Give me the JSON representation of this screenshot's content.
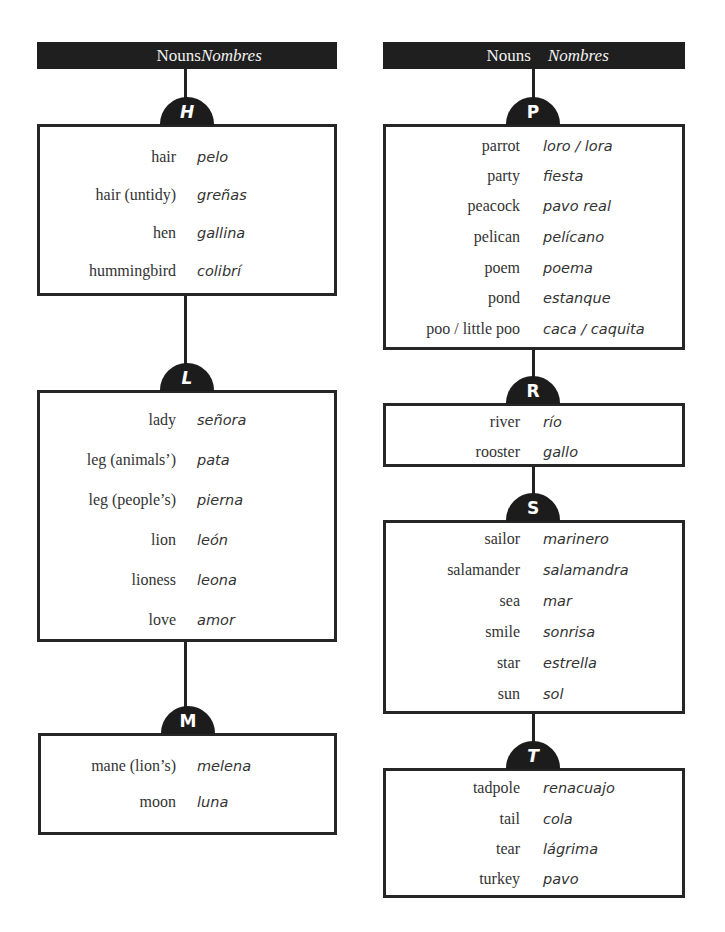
{
  "columns": [
    {
      "header": {
        "en": "Nouns",
        "es": "Nombres"
      },
      "sections": [
        {
          "letter": "H",
          "entries": [
            {
              "en": "hair",
              "es": "pelo"
            },
            {
              "en": "hair (untidy)",
              "es": "greñas"
            },
            {
              "en": "hen",
              "es": "gallina"
            },
            {
              "en": "hummingbird",
              "es": "colibrí"
            }
          ]
        },
        {
          "letter": "L",
          "entries": [
            {
              "en": "lady",
              "es": "señora"
            },
            {
              "en": "leg (animals’)",
              "es": "pata"
            },
            {
              "en": "leg (people’s)",
              "es": "pierna"
            },
            {
              "en": "lion",
              "es": "león"
            },
            {
              "en": "lioness",
              "es": "leona"
            },
            {
              "en": "love",
              "es": "amor"
            }
          ]
        },
        {
          "letter": "M",
          "entries": [
            {
              "en": "mane (lion’s)",
              "es": "melena"
            },
            {
              "en": "moon",
              "es": "luna"
            }
          ]
        }
      ]
    },
    {
      "header": {
        "en": "Nouns",
        "es": "Nombres"
      },
      "sections": [
        {
          "letter": "P",
          "entries": [
            {
              "en": "parrot",
              "es": "loro / lora"
            },
            {
              "en": "party",
              "es": "fiesta"
            },
            {
              "en": "peacock",
              "es": "pavo real"
            },
            {
              "en": "pelican",
              "es": "pelícano"
            },
            {
              "en": "poem",
              "es": "poema"
            },
            {
              "en": "pond",
              "es": "estanque"
            },
            {
              "en": "poo / little poo",
              "es": "caca / caquita"
            }
          ]
        },
        {
          "letter": "R",
          "entries": [
            {
              "en": "river",
              "es": "río"
            },
            {
              "en": "rooster",
              "es": "gallo"
            }
          ]
        },
        {
          "letter": "S",
          "entries": [
            {
              "en": "sailor",
              "es": "marinero"
            },
            {
              "en": "salamander",
              "es": "salamandra"
            },
            {
              "en": "sea",
              "es": "mar"
            },
            {
              "en": "smile",
              "es": "sonrisa"
            },
            {
              "en": "star",
              "es": "estrella"
            },
            {
              "en": "sun",
              "es": "sol"
            }
          ]
        },
        {
          "letter": "T",
          "entries": [
            {
              "en": "tadpole",
              "es": "renacuajo"
            },
            {
              "en": "tail",
              "es": "cola"
            },
            {
              "en": "tear",
              "es": "lágrima"
            },
            {
              "en": "turkey",
              "es": "pavo"
            }
          ]
        }
      ]
    }
  ]
}
